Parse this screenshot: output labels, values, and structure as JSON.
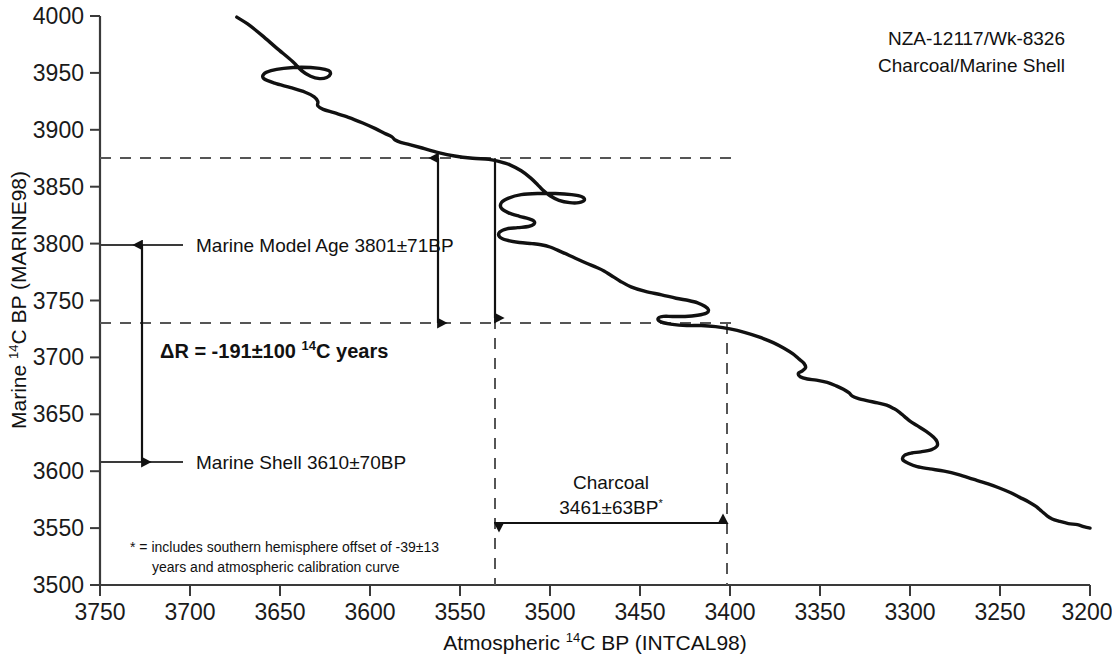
{
  "header": {
    "line1": "NZA-12117/Wk-8326",
    "line2": "Charcoal/Marine Shell"
  },
  "annotations": {
    "marine_model_age": "Marine Model Age 3801±71BP",
    "marine_shell": "Marine Shell 3610±70BP",
    "delta_r_prefix": "ΔR = -191±100 ",
    "delta_r_sup": "14",
    "delta_r_suffix": "C years",
    "charcoal_label": "Charcoal",
    "charcoal_value": "3461±63BP",
    "charcoal_star": "*",
    "footnote_line1": "* = includes southern hemisphere offset of -39±13",
    "footnote_line2": "years and atmospheric calibration curve"
  },
  "axis": {
    "y_title_pre": "Marine ",
    "y_title_sup": "14",
    "y_title_post": "C BP (MARINE98)",
    "x_title_pre": "Atmospheric ",
    "x_title_sup": "14",
    "x_title_post": "C BP (INTCAL98)"
  },
  "colors": {
    "curve": "#111111",
    "axis": "#3a3a3a",
    "dashed": "#555555",
    "text": "#111111"
  },
  "chart_data": {
    "type": "line",
    "title": "NZA-12117/Wk-8326 Charcoal/Marine Shell",
    "xlabel": "Atmospheric 14C BP (INTCAL98)",
    "ylabel": "Marine 14C BP (MARINE98)",
    "xlim": [
      3750,
      3200
    ],
    "ylim": [
      3500,
      4000
    ],
    "x_ticks": [
      3750,
      3700,
      3650,
      3600,
      3550,
      3500,
      3450,
      3400,
      3350,
      3300,
      3250,
      3200
    ],
    "y_ticks": [
      3500,
      3550,
      3600,
      3650,
      3700,
      3750,
      3800,
      3850,
      3900,
      3950,
      4000
    ],
    "x_axis_inverted": true,
    "y_axis_inverted": false,
    "grid": false,
    "legend": "none",
    "series": [
      {
        "name": "Marine calibration curve (MARINE98 vs INTCAL98)",
        "points": [
          [
            3674,
            3999
          ],
          [
            3668,
            3993
          ],
          [
            3660,
            3983
          ],
          [
            3652,
            3972
          ],
          [
            3643,
            3960
          ],
          [
            3638,
            3952
          ],
          [
            3633,
            3947
          ],
          [
            3628,
            3945
          ],
          [
            3624,
            3946
          ],
          [
            3622,
            3949
          ],
          [
            3623,
            3952
          ],
          [
            3628,
            3954
          ],
          [
            3638,
            3955
          ],
          [
            3648,
            3954
          ],
          [
            3655,
            3952
          ],
          [
            3659,
            3949
          ],
          [
            3659,
            3945
          ],
          [
            3653,
            3941
          ],
          [
            3644,
            3937
          ],
          [
            3636,
            3933
          ],
          [
            3631,
            3929
          ],
          [
            3629,
            3925
          ],
          [
            3629,
            3921
          ],
          [
            3626,
            3918
          ],
          [
            3620,
            3915
          ],
          [
            3612,
            3911
          ],
          [
            3604,
            3906
          ],
          [
            3597,
            3901
          ],
          [
            3592,
            3897
          ],
          [
            3588,
            3894
          ],
          [
            3586,
            3891
          ],
          [
            3583,
            3889
          ],
          [
            3578,
            3887
          ],
          [
            3571,
            3884
          ],
          [
            3562,
            3880
          ],
          [
            3553,
            3877
          ],
          [
            3543,
            3875
          ],
          [
            3534,
            3874
          ],
          [
            3528,
            3872
          ],
          [
            3522,
            3869
          ],
          [
            3516,
            3864
          ],
          [
            3511,
            3858
          ],
          [
            3507,
            3852
          ],
          [
            3504,
            3847
          ],
          [
            3500,
            3842
          ],
          [
            3495,
            3838
          ],
          [
            3489,
            3836
          ],
          [
            3484,
            3836
          ],
          [
            3481,
            3838
          ],
          [
            3482,
            3841
          ],
          [
            3488,
            3843
          ],
          [
            3497,
            3844
          ],
          [
            3507,
            3844
          ],
          [
            3516,
            3843
          ],
          [
            3523,
            3840
          ],
          [
            3527,
            3836
          ],
          [
            3527,
            3831
          ],
          [
            3523,
            3827
          ],
          [
            3517,
            3824
          ],
          [
            3512,
            3822
          ],
          [
            3509,
            3820
          ],
          [
            3509,
            3817
          ],
          [
            3512,
            3815
          ],
          [
            3518,
            3814
          ],
          [
            3524,
            3813
          ],
          [
            3528,
            3810
          ],
          [
            3528,
            3806
          ],
          [
            3524,
            3803
          ],
          [
            3517,
            3801
          ],
          [
            3510,
            3800
          ],
          [
            3505,
            3799
          ],
          [
            3500,
            3797
          ],
          [
            3494,
            3793
          ],
          [
            3487,
            3788
          ],
          [
            3480,
            3783
          ],
          [
            3474,
            3779
          ],
          [
            3470,
            3776
          ],
          [
            3466,
            3772
          ],
          [
            3461,
            3767
          ],
          [
            3455,
            3762
          ],
          [
            3447,
            3758
          ],
          [
            3438,
            3755
          ],
          [
            3430,
            3752
          ],
          [
            3423,
            3750
          ],
          [
            3418,
            3748
          ],
          [
            3414,
            3745
          ],
          [
            3412,
            3742
          ],
          [
            3413,
            3739
          ],
          [
            3418,
            3737
          ],
          [
            3425,
            3736
          ],
          [
            3432,
            3736
          ],
          [
            3437,
            3736
          ],
          [
            3440,
            3734
          ],
          [
            3438,
            3731
          ],
          [
            3432,
            3729
          ],
          [
            3424,
            3728
          ],
          [
            3416,
            3728
          ],
          [
            3408,
            3727
          ],
          [
            3400,
            3725
          ],
          [
            3392,
            3722
          ],
          [
            3384,
            3718
          ],
          [
            3376,
            3713
          ],
          [
            3370,
            3708
          ],
          [
            3365,
            3703
          ],
          [
            3362,
            3699
          ],
          [
            3359,
            3695
          ],
          [
            3358,
            3691
          ],
          [
            3360,
            3688
          ],
          [
            3362,
            3686
          ],
          [
            3361,
            3683
          ],
          [
            3357,
            3681
          ],
          [
            3352,
            3680
          ],
          [
            3346,
            3678
          ],
          [
            3341,
            3675
          ],
          [
            3337,
            3672
          ],
          [
            3334,
            3669
          ],
          [
            3332,
            3666
          ],
          [
            3329,
            3664
          ],
          [
            3324,
            3662
          ],
          [
            3318,
            3660
          ],
          [
            3313,
            3658
          ],
          [
            3309,
            3655
          ],
          [
            3306,
            3652
          ],
          [
            3303,
            3648
          ],
          [
            3300,
            3644
          ],
          [
            3296,
            3640
          ],
          [
            3291,
            3635
          ],
          [
            3287,
            3630
          ],
          [
            3285,
            3626
          ],
          [
            3285,
            3622
          ],
          [
            3288,
            3619
          ],
          [
            3294,
            3617
          ],
          [
            3299,
            3616
          ],
          [
            3303,
            3614
          ],
          [
            3304,
            3610
          ],
          [
            3301,
            3607
          ],
          [
            3296,
            3604
          ],
          [
            3289,
            3602
          ],
          [
            3281,
            3600
          ],
          [
            3273,
            3597
          ],
          [
            3265,
            3593
          ],
          [
            3257,
            3589
          ],
          [
            3250,
            3585
          ],
          [
            3244,
            3581
          ],
          [
            3239,
            3577
          ],
          [
            3234,
            3573
          ],
          [
            3230,
            3569
          ],
          [
            3227,
            3565
          ],
          [
            3224,
            3561
          ],
          [
            3221,
            3558
          ],
          [
            3217,
            3556
          ],
          [
            3212,
            3554
          ],
          [
            3207,
            3553
          ],
          [
            3203,
            3551
          ],
          [
            3200,
            3550
          ]
        ]
      }
    ],
    "reference_lines": [
      {
        "kind": "horizontal",
        "value": 3875,
        "style": "dashed",
        "label": "marine model upper"
      },
      {
        "kind": "horizontal",
        "value": 3730,
        "style": "dashed",
        "label": "marine model lower"
      },
      {
        "kind": "vertical",
        "value": 3530,
        "style": "dashed",
        "label": "charcoal upper bound"
      },
      {
        "kind": "vertical",
        "value": 3400,
        "style": "dashed",
        "label": "charcoal lower bound"
      },
      {
        "kind": "horizontal",
        "value": 3801,
        "style": "solid",
        "label": "Marine Model Age 3801±71BP"
      },
      {
        "kind": "horizontal",
        "value": 3610,
        "style": "solid",
        "label": "Marine Shell 3610±70BP"
      }
    ],
    "measurements": {
      "marine_model_age": {
        "value": 3801,
        "error": 71,
        "unit": "BP"
      },
      "marine_shell": {
        "value": 3610,
        "error": 70,
        "unit": "BP"
      },
      "charcoal": {
        "value": 3461,
        "error": 63,
        "unit": "BP"
      },
      "delta_r": {
        "value": -191,
        "error": 100,
        "unit": "14C years"
      },
      "southern_hemisphere_offset": {
        "value": -39,
        "error": 13,
        "unit": "years"
      }
    }
  }
}
